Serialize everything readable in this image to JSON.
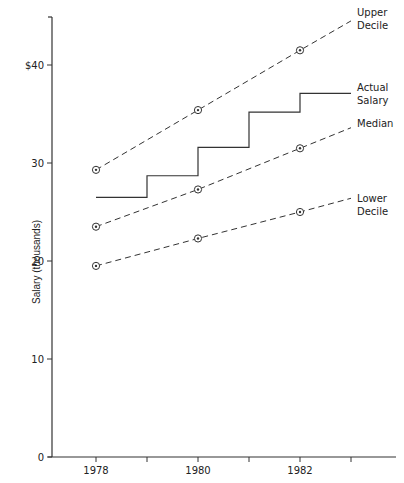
{
  "chart_data": {
    "type": "line",
    "title": "",
    "xlabel": "",
    "ylabel": "Salary (thousands)",
    "ylim": [
      0,
      45
    ],
    "xlim": [
      1977.2,
      1983.9
    ],
    "grid": false,
    "legend_position": "inline-right",
    "y_ticks": [
      {
        "value": 0,
        "label": "0"
      },
      {
        "value": 10,
        "label": "10"
      },
      {
        "value": 20,
        "label": "20"
      },
      {
        "value": 30,
        "label": "30"
      },
      {
        "value": 40,
        "label": "$40"
      }
    ],
    "x_ticks": [
      1978,
      1979,
      1980,
      1981,
      1982,
      1983
    ],
    "x_tick_labels": [
      {
        "value": 1978,
        "label": "1978"
      },
      {
        "value": 1980,
        "label": "1980"
      },
      {
        "value": 1982,
        "label": "1982"
      }
    ],
    "series": [
      {
        "name": "Upper Decile",
        "label_lines": [
          "Upper",
          "Decile"
        ],
        "style": "dashed",
        "markers": "circle-dot",
        "x": [
          1978,
          1980,
          1982
        ],
        "values": [
          29.3,
          35.4,
          41.5
        ],
        "extends_to": [
          1983,
          44.5
        ]
      },
      {
        "name": "Actual Salary",
        "label_lines": [
          "Actual",
          "Salary"
        ],
        "style": "solid-step",
        "steps": [
          {
            "from": 1978,
            "to": 1979,
            "value": 26.5
          },
          {
            "from": 1979,
            "to": 1980,
            "value": 28.7
          },
          {
            "from": 1980,
            "to": 1981,
            "value": 31.6
          },
          {
            "from": 1981,
            "to": 1982,
            "value": 35.2
          },
          {
            "from": 1982,
            "to": 1983,
            "value": 37.1
          }
        ]
      },
      {
        "name": "Median",
        "label_lines": [
          "Median"
        ],
        "style": "dashed",
        "markers": "circle-dot",
        "x": [
          1978,
          1980,
          1982
        ],
        "values": [
          23.5,
          27.3,
          31.5
        ],
        "extends_to": [
          1983,
          33.6
        ]
      },
      {
        "name": "Lower Decile",
        "label_lines": [
          "Lower",
          "Decile"
        ],
        "style": "dashed",
        "markers": "circle-dot",
        "x": [
          1978,
          1980,
          1982
        ],
        "values": [
          19.5,
          22.3,
          25.0
        ],
        "extends_to": [
          1983,
          26.4
        ]
      }
    ]
  },
  "colors": {
    "line": "#333333",
    "text": "#222222",
    "background": "#ffffff"
  }
}
